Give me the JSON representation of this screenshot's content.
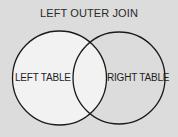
{
  "diagram": {
    "title": "LEFT OUTER JOIN",
    "type": "venn",
    "sets": [
      {
        "id": "left",
        "label": "LEFT TABLE",
        "highlighted": true
      },
      {
        "id": "right",
        "label": "RIGHT TABLE",
        "highlighted": false
      }
    ],
    "highlighted_region": "left table including intersection",
    "colors": {
      "background": "#dcdcdc",
      "highlight_fill": "#f2f2f2",
      "outline": "#1a1a1a",
      "text": "#1e1e1e"
    }
  }
}
